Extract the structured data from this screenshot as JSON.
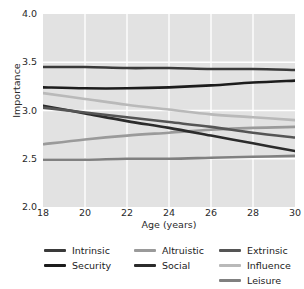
{
  "chart_data": {
    "type": "line",
    "title": "",
    "xlabel": "Age (years)",
    "ylabel": "Importance",
    "xlim": [
      18,
      30
    ],
    "ylim": [
      2.0,
      4.0
    ],
    "xticks": [
      "18",
      "20",
      "22",
      "24",
      "26",
      "28",
      "30"
    ],
    "yticks": [
      "2.0",
      "2.5",
      "3.0",
      "3.5",
      "4.0"
    ],
    "grid": true,
    "legend_position": "bottom",
    "x": [
      18,
      20,
      22,
      24,
      26,
      28,
      30
    ],
    "series": [
      {
        "name": "Intrinsic",
        "color": "#3a3a3a",
        "values": [
          3.45,
          3.45,
          3.44,
          3.44,
          3.43,
          3.43,
          3.42
        ]
      },
      {
        "name": "Security",
        "color": "#1c1c1c",
        "values": [
          3.24,
          3.23,
          3.23,
          3.24,
          3.26,
          3.29,
          3.31
        ]
      },
      {
        "name": "Altruistic",
        "color": "#9a9a9a",
        "values": [
          2.65,
          2.7,
          2.74,
          2.77,
          2.8,
          2.82,
          2.83
        ]
      },
      {
        "name": "Social",
        "color": "#2b2b2b",
        "values": [
          3.05,
          2.97,
          2.89,
          2.82,
          2.74,
          2.66,
          2.58
        ]
      },
      {
        "name": "Extrinsic",
        "color": "#555555",
        "values": [
          3.03,
          2.98,
          2.93,
          2.88,
          2.83,
          2.77,
          2.72
        ]
      },
      {
        "name": "Influence",
        "color": "#b9b9b9",
        "values": [
          3.18,
          3.12,
          3.06,
          3.01,
          2.96,
          2.93,
          2.9
        ]
      },
      {
        "name": "Leisure",
        "color": "#808080",
        "values": [
          2.49,
          2.49,
          2.5,
          2.5,
          2.51,
          2.52,
          2.53
        ]
      }
    ]
  },
  "legend": {
    "columns": [
      [
        {
          "label": "Intrinsic",
          "color": "#3a3a3a"
        },
        {
          "label": "Security",
          "color": "#1c1c1c"
        }
      ],
      [
        {
          "label": "Altruistic",
          "color": "#9a9a9a"
        },
        {
          "label": "Social",
          "color": "#2b2b2b"
        }
      ],
      [
        {
          "label": "Extrinsic",
          "color": "#555555"
        },
        {
          "label": "Influence",
          "color": "#b9b9b9"
        },
        {
          "label": "Leisure",
          "color": "#808080"
        }
      ]
    ]
  }
}
